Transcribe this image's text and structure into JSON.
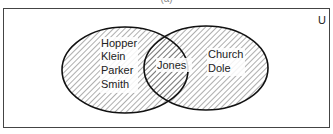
{
  "caption": "(a)",
  "diagram": {
    "universe_label": "U",
    "sets": [
      {
        "name": "left-set",
        "only_members": [
          "Hopper",
          "Klein",
          "Parker",
          "Smith"
        ]
      },
      {
        "name": "right-set",
        "only_members": [
          "Church",
          "Dole"
        ]
      }
    ],
    "intersection": [
      "Jones"
    ],
    "shading": "hatched (both sets)",
    "colors": {
      "line": "#111111",
      "background": "#ffffff"
    }
  }
}
